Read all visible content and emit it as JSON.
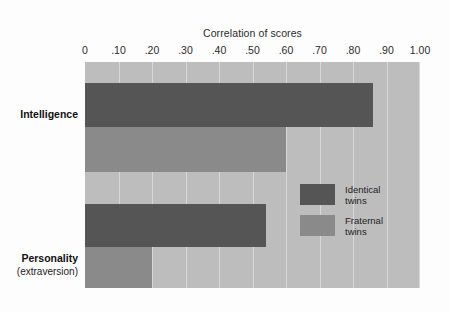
{
  "chart_data": {
    "type": "bar",
    "orientation": "horizontal",
    "title": "Correlation of scores",
    "xlabel": "",
    "ylabel": "",
    "xlim": [
      0,
      1.0
    ],
    "grid": true,
    "legend_position": "inside-right",
    "categories": [
      "Intelligence",
      "Personality"
    ],
    "category_sublabels": [
      "",
      "(extraversion)"
    ],
    "tick_labels": [
      "0",
      ".10",
      ".20",
      ".30",
      ".40",
      ".50",
      ".60",
      ".70",
      ".80",
      ".90",
      "1.00"
    ],
    "tick_values": [
      0,
      0.1,
      0.2,
      0.3,
      0.4,
      0.5,
      0.6,
      0.7,
      0.8,
      0.9,
      1.0
    ],
    "series": [
      {
        "name": "Identical twins",
        "color": "#555555",
        "values": [
          0.86,
          0.54
        ]
      },
      {
        "name": "Fraternal twins",
        "color": "#8a8a8a",
        "values": [
          0.6,
          0.2
        ]
      }
    ],
    "colors": {
      "plot_background": "#bdbdbd",
      "page_background": "#fdfdfd",
      "gridline": "#d8d8d8",
      "identical": "#555555",
      "fraternal": "#8a8a8a",
      "text": "#2b2b2b"
    }
  },
  "legend": {
    "items": [
      {
        "label_line1": "Identical",
        "label_line2": "twins",
        "color_key": "identical"
      },
      {
        "label_line1": "Fraternal",
        "label_line2": "twins",
        "color_key": "fraternal"
      }
    ]
  }
}
